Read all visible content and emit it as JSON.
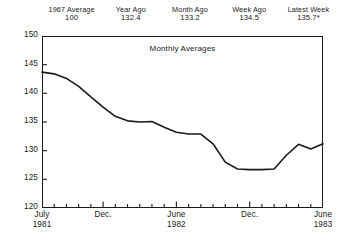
{
  "header": {
    "stats": [
      {
        "label": "1967 Average",
        "value": "100"
      },
      {
        "label": "Year Ago",
        "value": "132.4"
      },
      {
        "label": "Month Ago",
        "value": "133.2"
      },
      {
        "label": "Week Ago",
        "value": "134.5"
      },
      {
        "label": "Latest Week",
        "value": "135.7*"
      }
    ]
  },
  "chart_data": {
    "type": "line",
    "title": "Monthly Averages",
    "xlabel": "",
    "ylabel": "",
    "ylim": [
      120,
      150
    ],
    "ytick_labels": [
      "150",
      "145",
      "140",
      "135",
      "130",
      "125",
      "120"
    ],
    "ytick_values": [
      150,
      145,
      140,
      135,
      130,
      125,
      120
    ],
    "grid": false,
    "legend": "none",
    "x": [
      "July 1981",
      "Aug 1981",
      "Sept 1981",
      "Oct 1981",
      "Nov 1981",
      "Dec 1981",
      "Jan 1982",
      "Feb 1982",
      "Mar 1982",
      "Apr 1982",
      "May 1982",
      "June 1982",
      "July 1982",
      "Aug 1982",
      "Sept 1982",
      "Oct 1982",
      "Nov 1982",
      "Dec 1982",
      "Jan 1983",
      "Feb 1983",
      "Mar 1983",
      "Apr 1983",
      "May 1983",
      "June 1983"
    ],
    "values": [
      143.7,
      143.4,
      142.6,
      141.2,
      139.4,
      137.6,
      136.0,
      135.2,
      135.0,
      135.1,
      134.1,
      133.2,
      132.9,
      132.9,
      131.2,
      128.0,
      126.8,
      126.7,
      126.7,
      126.8,
      129.2,
      131.1,
      130.3,
      131.2
    ],
    "xtick_labels": [
      {
        "line1": "July",
        "line2": "1981",
        "position_fraction": 0.0
      },
      {
        "line1": "Dec.",
        "line2": "",
        "position_fraction": 0.2174
      },
      {
        "line1": "June",
        "line2": "1982",
        "position_fraction": 0.4783
      },
      {
        "line1": "Dec.",
        "line2": "",
        "position_fraction": 0.7391
      },
      {
        "line1": "June",
        "line2": "1983",
        "position_fraction": 1.0
      }
    ],
    "minor_ticks_count": 24,
    "line_color": "#1a1a1a",
    "frame_color": "#1a1a1a"
  }
}
